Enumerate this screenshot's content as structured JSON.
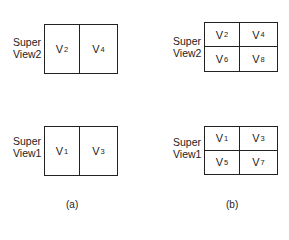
{
  "panel_a": {
    "caption": "(a)",
    "top": {
      "label_line1": "Super",
      "label_line2": "View2",
      "cells": [
        {
          "v": "V",
          "sub": "2"
        },
        {
          "v": "V",
          "sub": "4"
        }
      ]
    },
    "bottom": {
      "label_line1": "Super",
      "label_line2": "View1",
      "cells": [
        {
          "v": "V",
          "sub": "1"
        },
        {
          "v": "V",
          "sub": "3"
        }
      ]
    }
  },
  "panel_b": {
    "caption": "(b)",
    "top": {
      "label_line1": "Super",
      "label_line2": "View2",
      "cells": [
        {
          "v": "V",
          "sub": "2"
        },
        {
          "v": "V",
          "sub": "4"
        },
        {
          "v": "V",
          "sub": "6"
        },
        {
          "v": "V",
          "sub": "8"
        }
      ]
    },
    "bottom": {
      "label_line1": "Super",
      "label_line2": "View1",
      "cells": [
        {
          "v": "V",
          "sub": "1"
        },
        {
          "v": "V",
          "sub": "3"
        },
        {
          "v": "V",
          "sub": "5"
        },
        {
          "v": "V",
          "sub": "7"
        }
      ]
    }
  }
}
